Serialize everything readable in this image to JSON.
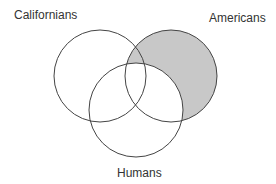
{
  "diagram": {
    "type": "venn",
    "sets": [
      {
        "id": "californians",
        "label": "Californians",
        "cx": 100,
        "cy": 76,
        "r": 46
      },
      {
        "id": "americans",
        "label": "Americans",
        "cx": 171,
        "cy": 76,
        "r": 46
      },
      {
        "id": "humans",
        "label": "Humans",
        "cx": 136,
        "cy": 110,
        "r": 47
      }
    ],
    "shaded_region": "Americans minus Humans",
    "colors": {
      "shade": "#c8c8c8",
      "stroke": "#444444",
      "background": "#ffffff"
    }
  }
}
